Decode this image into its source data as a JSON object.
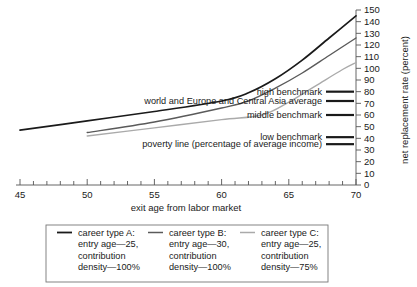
{
  "chart_data": {
    "type": "line",
    "title": "",
    "xlabel": "exit age from labor market",
    "ylabel": "net replacement rate (percent)",
    "xlim": [
      44,
      71
    ],
    "ylim": [
      0,
      150
    ],
    "x_ticks": [
      45,
      50,
      55,
      60,
      65,
      70
    ],
    "x_minor_step": 1,
    "y_ticks": [
      0,
      10,
      20,
      30,
      40,
      50,
      60,
      70,
      80,
      90,
      100,
      110,
      120,
      130,
      140,
      150
    ],
    "grid": false,
    "legend_position": "below-plot",
    "series": [
      {
        "name": "career type A: entry age—25, contribution density—100%",
        "short_name": "career type A",
        "color": "#1a1a1a",
        "x": [
          45,
          50,
          55,
          60,
          62,
          64,
          66,
          68,
          70
        ],
        "values": [
          47,
          55,
          63,
          72,
          79,
          91,
          107,
          126,
          145
        ]
      },
      {
        "name": "career type B: entry age—30, contribution density—100%",
        "short_name": "career type B",
        "color": "#5a5a5a",
        "x": [
          50,
          55,
          60,
          62,
          64,
          66,
          68,
          70
        ],
        "values": [
          45,
          54,
          66,
          72,
          83,
          96,
          111,
          126
        ]
      },
      {
        "name": "career type C: entry age—25, contribution density—75%",
        "short_name": "career type C",
        "color": "#aaaaaa",
        "x": [
          50,
          55,
          60,
          63,
          65,
          67,
          69,
          70
        ],
        "values": [
          42,
          49,
          56,
          60,
          71,
          85,
          99,
          105
        ]
      }
    ],
    "benchmarks": [
      {
        "label": "high benchmark",
        "value": 80
      },
      {
        "label": "world and Europe and Central Asia average",
        "value": 72
      },
      {
        "label": "middle benchmark",
        "value": 60
      },
      {
        "label": "low benchmark",
        "value": 41
      },
      {
        "label": "poverty line (percentage of average income)",
        "value": 35
      }
    ]
  },
  "axes": {
    "x_title": "exit age from labor market",
    "y_title": "net replacement rate (percent)",
    "x_tick_labels": [
      "45",
      "50",
      "55",
      "60",
      "65",
      "70"
    ],
    "y_tick_labels": [
      "0",
      "10",
      "20",
      "30",
      "40",
      "50",
      "60",
      "70",
      "80",
      "90",
      "100",
      "110",
      "120",
      "130",
      "140",
      "150"
    ]
  },
  "annotations": {
    "high_benchmark": "high benchmark",
    "world_average": "world and Europe and Central Asia average",
    "middle_benchmark": "middle benchmark",
    "low_benchmark": "low benchmark",
    "poverty_line": "poverty line (percentage of average income)"
  },
  "legend": {
    "entries": [
      {
        "line1": "career type  A:",
        "line2": "entry age—25,",
        "line3": "contribution",
        "line4": "density—100%",
        "color": "#1a1a1a"
      },
      {
        "line1": "career type  B:",
        "line2": "entry age—30,",
        "line3": "contribution",
        "line4": "density—100%",
        "color": "#5a5a5a"
      },
      {
        "line1": "career type  C:",
        "line2": "entry age—25,",
        "line3": "contribution",
        "line4": "density—75%",
        "color": "#aaaaaa"
      }
    ]
  },
  "colors": {
    "series_a": "#1a1a1a",
    "series_b": "#5a5a5a",
    "series_c": "#aaaaaa",
    "axis": "#555555",
    "text": "#1a1a1a",
    "legend_border": "#777777",
    "background": "#ffffff"
  }
}
